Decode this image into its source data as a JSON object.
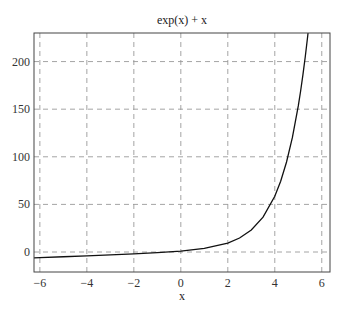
{
  "chart_data": {
    "type": "line",
    "title": "exp(x) + x",
    "xlabel": "x",
    "ylabel": "",
    "xlim": [
      -6.25,
      6.35
    ],
    "ylim": [
      -21,
      230
    ],
    "xticks": [
      -6,
      -4,
      -2,
      0,
      2,
      4,
      6
    ],
    "xtick_labels": [
      "−6",
      "−4",
      "−2",
      "0",
      "2",
      "4",
      "6"
    ],
    "yticks": [
      0,
      50,
      100,
      150,
      200
    ],
    "ytick_labels": [
      "0",
      "50",
      "100",
      "150",
      "200"
    ],
    "grid": true,
    "legend": null,
    "series": [
      {
        "name": "exp(x) + x",
        "color": "#111111",
        "x": [
          -6.25,
          -6,
          -5,
          -4,
          -3,
          -2,
          -1,
          0,
          1,
          2,
          2.5,
          3,
          3.5,
          4,
          4.25,
          4.5,
          4.75,
          5,
          5.1,
          5.2,
          5.3,
          5.4,
          5.43
        ],
        "y": [
          -6.248,
          -5.998,
          -4.993,
          -3.982,
          -2.95,
          -1.865,
          -0.632,
          1.0,
          3.718,
          9.389,
          14.68,
          23.09,
          36.62,
          58.6,
          74.35,
          94.52,
          120.3,
          153.4,
          169.1,
          186.5,
          205.6,
          226.6,
          233.6
        ]
      }
    ]
  }
}
